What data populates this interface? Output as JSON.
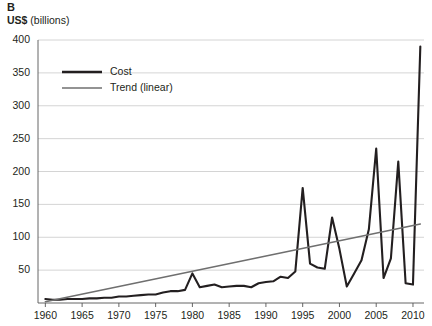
{
  "panel": {
    "letter": "B"
  },
  "axis_unit": {
    "strong": "US$",
    "light": " (billions)"
  },
  "legend": {
    "position": "inside-top-left",
    "items": [
      {
        "label": "Cost",
        "color": "#231f20",
        "width": 2.6
      },
      {
        "label": "Trend (linear)",
        "color": "#6f6f6f",
        "width": 1.6
      }
    ]
  },
  "chart_data": {
    "type": "line",
    "title": "",
    "subtitle": "",
    "xlabel": "",
    "ylabel": "US$ (billions)",
    "xlim": [
      1959,
      2011.5
    ],
    "ylim": [
      0,
      400
    ],
    "grid": true,
    "grid_axis": "y",
    "yticks": [
      50,
      100,
      150,
      200,
      250,
      300,
      350,
      400
    ],
    "ytick_labels": [
      "50",
      "100",
      "150",
      "200",
      "250",
      "300",
      "350",
      "400"
    ],
    "xticks": [
      1960,
      1965,
      1970,
      1975,
      1980,
      1985,
      1990,
      1995,
      2000,
      2005,
      2010
    ],
    "xtick_labels": [
      "1960",
      "1965",
      "1970",
      "1975",
      "1980",
      "1985",
      "1990",
      "1995",
      "2000",
      "2005",
      "2010"
    ],
    "series": [
      {
        "name": "Cost",
        "color": "#231f20",
        "x": [
          1960,
          1961,
          1962,
          1963,
          1964,
          1965,
          1966,
          1967,
          1968,
          1969,
          1970,
          1971,
          1972,
          1973,
          1974,
          1975,
          1976,
          1977,
          1978,
          1979,
          1980,
          1981,
          1982,
          1983,
          1984,
          1985,
          1986,
          1987,
          1988,
          1989,
          1990,
          1991,
          1992,
          1993,
          1994,
          1995,
          1996,
          1997,
          1998,
          1999,
          2000,
          2001,
          2002,
          2003,
          2004,
          2005,
          2006,
          2007,
          2008,
          2009,
          2010,
          2011
        ],
        "values": [
          6,
          5,
          5,
          6,
          6,
          6,
          7,
          7,
          8,
          8,
          10,
          10,
          11,
          12,
          13,
          13,
          16,
          18,
          18,
          20,
          45,
          24,
          26,
          28,
          24,
          25,
          26,
          26,
          24,
          30,
          32,
          33,
          40,
          38,
          48,
          175,
          60,
          54,
          52,
          130,
          82,
          25,
          45,
          65,
          112,
          235,
          38,
          68,
          215,
          30,
          28,
          390
        ]
      },
      {
        "name": "Trend (linear)",
        "color": "#6f6f6f",
        "x": [
          1960,
          2011
        ],
        "values": [
          2,
          120
        ]
      }
    ]
  }
}
